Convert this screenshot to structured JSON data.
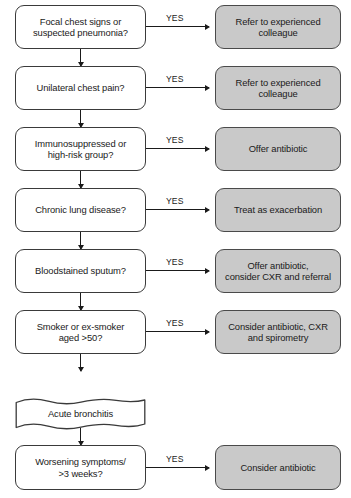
{
  "diagram": {
    "colors": {
      "question_fill": "#ffffff",
      "action_fill": "#c9c9c9",
      "stroke": "#3a3a3a",
      "text": "#1a1a1a",
      "background": "#ffffff"
    },
    "branch_label": "YES",
    "rows": [
      {
        "id": "row-focal-chest-signs",
        "question": "Focal chest signs or suspected pneumonia?",
        "question_lines": [
          "Focal chest signs or",
          "suspected pneumonia?"
        ],
        "yes_label": "YES",
        "action": "Refer to experienced colleague",
        "action_lines": [
          "Refer to experienced",
          "colleague"
        ]
      },
      {
        "id": "row-unilateral-chest-pain",
        "question": "Unilateral chest pain?",
        "question_lines": [
          "Unilateral chest pain?"
        ],
        "yes_label": "YES",
        "action": "Refer to experienced colleague",
        "action_lines": [
          "Refer to experienced",
          "colleague"
        ]
      },
      {
        "id": "row-immunosuppressed",
        "question": "Immunosuppressed or high-risk group?",
        "question_lines": [
          "Immunosuppressed or",
          "high-risk group?"
        ],
        "yes_label": "YES",
        "action": "Offer antibiotic",
        "action_lines": [
          "Offer antibiotic"
        ]
      },
      {
        "id": "row-chronic-lung-disease",
        "question": "Chronic lung disease?",
        "question_lines": [
          "Chronic lung disease?"
        ],
        "yes_label": "YES",
        "action": "Treat as exacerbation",
        "action_lines": [
          "Treat as exacerbation"
        ]
      },
      {
        "id": "row-bloodstained-sputum",
        "question": "Bloodstained sputum?",
        "question_lines": [
          "Bloodstained sputum?"
        ],
        "yes_label": "YES",
        "action": "Offer antibiotic, consider CXR and referral",
        "action_lines": [
          "Offer antibiotic,",
          "consider CXR and referral"
        ]
      },
      {
        "id": "row-smoker",
        "question": "Smoker or ex-smoker aged >50?",
        "question_lines": [
          "Smoker or ex-smoker",
          "aged >50?"
        ],
        "yes_label": "YES",
        "action": "Consider antibiotic, CXR and spirometry",
        "action_lines": [
          "Consider antibiotic, CXR",
          "and spirometry"
        ]
      }
    ],
    "terminal": {
      "id": "node-acute-bronchitis",
      "label": "Acute bronchitis"
    },
    "final_row": {
      "id": "row-worsening-symptoms",
      "question": "Worsening symptoms/ >3 weeks?",
      "question_lines": [
        "Worsening symptoms/",
        ">3 weeks?"
      ],
      "yes_label": "YES",
      "action": "Consider antibiotic",
      "action_lines": [
        "Consider antibiotic"
      ]
    }
  }
}
